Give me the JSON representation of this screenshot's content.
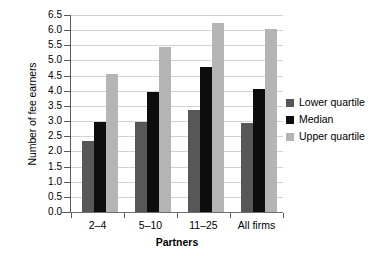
{
  "chart_data": {
    "type": "bar",
    "title": "",
    "xlabel": "Partners",
    "ylabel": "Number of fee earners",
    "categories": [
      "2–4",
      "5–10",
      "11–25",
      "All firms"
    ],
    "series": [
      {
        "name": "Lower quartile",
        "color": "#575757",
        "values": [
          2.35,
          2.98,
          3.35,
          2.93
        ]
      },
      {
        "name": "Median",
        "color": "#0d0d0d",
        "values": [
          2.98,
          3.95,
          4.78,
          4.05
        ]
      },
      {
        "name": "Upper quartile",
        "color": "#b4b4b4",
        "values": [
          4.55,
          5.45,
          6.23,
          6.03
        ]
      }
    ],
    "ylim": [
      0.0,
      6.5
    ],
    "ytick_step": 0.5,
    "ytick_labels": [
      "0.0",
      "0.5",
      "1.0",
      "1.5",
      "2.0",
      "2.5",
      "3.0",
      "3.5",
      "4.0",
      "4.5",
      "5.0",
      "5.5",
      "6.0",
      "6.5"
    ],
    "grid": "horizontal",
    "legend_position": "right"
  }
}
